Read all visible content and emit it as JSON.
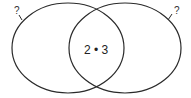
{
  "diagram": {
    "type": "venn",
    "sets": [
      {
        "id": "left",
        "label": "?"
      },
      {
        "id": "right",
        "label": "?"
      }
    ],
    "intersection": {
      "label": "2 • 3"
    },
    "colors": {
      "stroke": "#2a2a2a",
      "background": "#ffffff"
    }
  }
}
